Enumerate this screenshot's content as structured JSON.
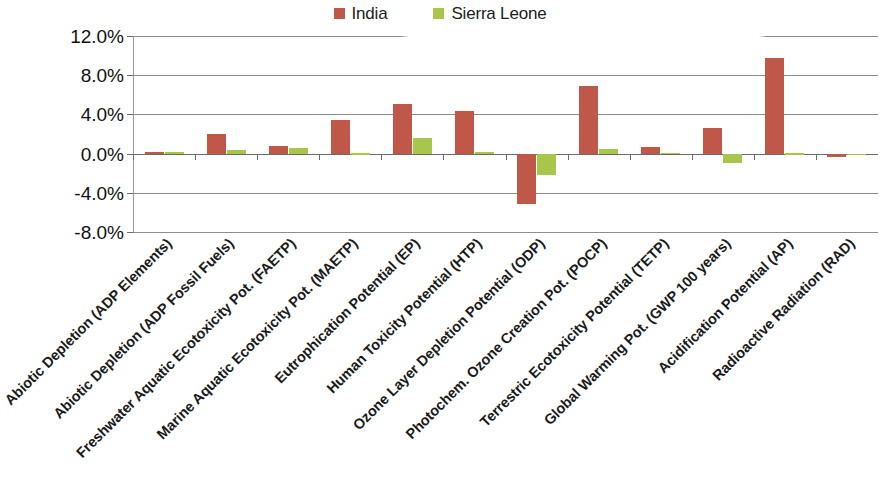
{
  "chart_data": {
    "type": "bar",
    "title": "",
    "subtitle": "",
    "xlabel": "",
    "ylabel": "",
    "grid": true,
    "legend_position": "top-center",
    "ylim": [
      -8.0,
      12.0
    ],
    "ytick_labels": [
      "12.0%",
      "8.0%",
      "4.0%",
      "0.0%",
      "-4.0%",
      "-8.0%"
    ],
    "ytick_values": [
      12.0,
      8.0,
      4.0,
      0.0,
      -4.0,
      -8.0
    ],
    "categories": [
      "Abiotic Depletion (ADP Elements)",
      "Abiotic Depletion (ADP Fossil Fuels)",
      "Freshwater Aquatic Ecotoxicity Pot. (FAETP)",
      "Marine Aquatic Ecotoxicity Pot. (MAETP)",
      "Eutrophication Potential (EP)",
      "Human Toxicity Potential (HTP)",
      "Ozone Layer Depletion Potential (ODP)",
      "Photochem. Ozone Creation Pot. (POCP)",
      "Terrestric Ecotoxicity Potential (TETP)",
      "Global Warming Pot. (GWP 100 years)",
      "Acidification Potential (AP)",
      "Radioactive Radiation (RAD)"
    ],
    "series": [
      {
        "name": "India",
        "color": "#c0584a",
        "values": [
          0.2,
          2.0,
          0.8,
          3.4,
          5.1,
          4.3,
          -5.1,
          6.9,
          0.7,
          2.6,
          9.8,
          -0.3
        ]
      },
      {
        "name": "Sierra Leone",
        "color": "#a8c64a",
        "values": [
          0.15,
          0.4,
          0.6,
          0.05,
          1.6,
          0.2,
          -2.2,
          0.5,
          0.1,
          -1.0,
          0.05,
          0.0
        ]
      }
    ]
  },
  "legend": {
    "entries": [
      {
        "label": "India",
        "color": "#c0584a"
      },
      {
        "label": "Sierra Leone",
        "color": "#a8c64a"
      }
    ]
  }
}
